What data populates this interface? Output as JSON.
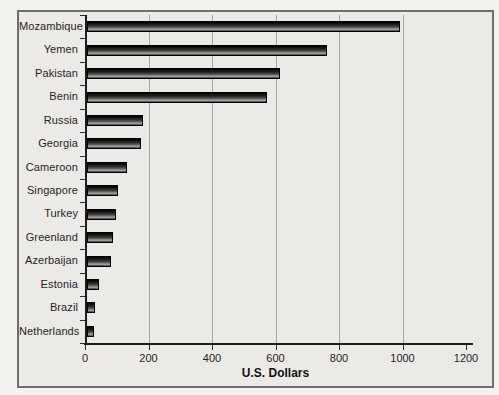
{
  "chart_data": {
    "type": "bar",
    "orientation": "horizontal",
    "title": "",
    "xlabel": "U.S. Dollars",
    "ylabel": "",
    "xlim": [
      0,
      1200
    ],
    "grid": "vertical-gridlines-at-major-ticks",
    "legend": "none",
    "xticks": [
      0,
      200,
      400,
      600,
      800,
      1000,
      1200
    ],
    "gridline_values": [
      200,
      400,
      600,
      800,
      1000
    ],
    "categories": [
      "Mozambique",
      "Yemen",
      "Pakistan",
      "Benin",
      "Russia",
      "Georgia",
      "Cameroon",
      "Singapore",
      "Turkey",
      "Greenland",
      "Azerbaijan",
      "Estonia",
      "Brazil",
      "Netherlands"
    ],
    "values": [
      980,
      750,
      600,
      560,
      170,
      165,
      120,
      90,
      85,
      75,
      70,
      30,
      20,
      15
    ],
    "colors": {
      "bar_dark": "#1a1a1a",
      "bar_highlight": "#a4a4a4",
      "background": "#eceae6",
      "page_background": "#f4f2ee",
      "gridline": "#a3a3a1",
      "axis": "#1c1c1c",
      "text": "#1f1f1f",
      "box_border": "#6e6e6e"
    }
  }
}
